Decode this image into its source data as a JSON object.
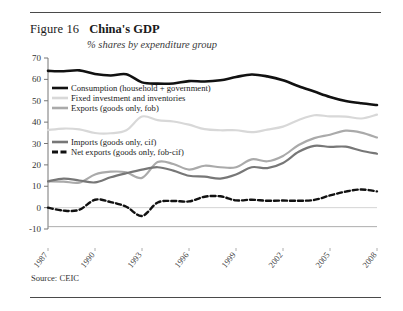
{
  "figure": {
    "number": "Figure 16",
    "title": "China's GDP",
    "subtitle": "% shares by expenditure group",
    "source": "Source: CEIC"
  },
  "chart_data": {
    "type": "line",
    "title": "China's GDP",
    "subtitle": "% shares by expenditure group",
    "xlabel": "",
    "ylabel": "",
    "ylim": [
      -10,
      70
    ],
    "ytick_labels": [
      "70",
      "60",
      "50",
      "40",
      "30",
      "20",
      "10",
      "0",
      "-10"
    ],
    "ytick_values": [
      70,
      60,
      50,
      40,
      30,
      20,
      10,
      0,
      -10
    ],
    "grid": false,
    "legend_position": "inside-upper-left",
    "x": [
      1987,
      1988,
      1989,
      1990,
      1991,
      1992,
      1993,
      1994,
      1995,
      1996,
      1997,
      1998,
      1999,
      2000,
      2001,
      2002,
      2003,
      2004,
      2005,
      2006,
      2007,
      2008
    ],
    "xtick_labels": [
      "1987",
      "1990",
      "1993",
      "1996",
      "1999",
      "2002",
      "2005",
      "2008"
    ],
    "xtick_values": [
      1987,
      1990,
      1993,
      1996,
      1999,
      2002,
      2005,
      2008
    ],
    "series": [
      {
        "name": "Consumption (household + government)",
        "color": "#111111",
        "style": "solid",
        "width": 2.6,
        "values": [
          64.0,
          63.8,
          64.2,
          62.5,
          61.8,
          62.4,
          58.6,
          58.0,
          58.1,
          59.2,
          59.0,
          59.6,
          61.1,
          62.3,
          61.4,
          59.6,
          56.8,
          54.3,
          51.8,
          49.9,
          48.8,
          48.0
        ]
      },
      {
        "name": "Fixed investment and inventories",
        "color": "#d8d8d8",
        "style": "solid",
        "width": 2.2,
        "values": [
          36.3,
          37.0,
          36.6,
          34.9,
          34.8,
          36.2,
          42.6,
          40.9,
          40.3,
          38.8,
          36.7,
          36.2,
          36.2,
          35.3,
          36.5,
          37.9,
          41.0,
          43.2,
          42.7,
          42.6,
          41.7,
          43.5
        ]
      },
      {
        "name": "Exports (goods only, fob)",
        "color": "#aaaaaa",
        "style": "solid",
        "width": 2.2,
        "values": [
          12.3,
          12.2,
          11.7,
          15.5,
          16.8,
          16.5,
          13.9,
          21.3,
          20.4,
          17.8,
          19.6,
          18.9,
          18.9,
          22.6,
          21.7,
          24.2,
          29.3,
          32.5,
          34.1,
          36.0,
          35.1,
          32.8
        ]
      },
      {
        "name": "Imports (goods only, cif)",
        "color": "#777777",
        "style": "solid",
        "width": 2.2,
        "values": [
          12.3,
          13.6,
          12.7,
          11.8,
          14.2,
          16.1,
          17.8,
          18.9,
          17.3,
          14.9,
          14.5,
          13.6,
          15.5,
          18.9,
          18.5,
          20.9,
          26.1,
          28.9,
          28.4,
          28.5,
          26.6,
          25.2
        ]
      },
      {
        "name": "Net exports (goods only, fob-cif)",
        "color": "#111111",
        "style": "dashed",
        "width": 2.4,
        "values": [
          0.0,
          -1.4,
          -1.0,
          3.7,
          2.6,
          0.4,
          -3.9,
          2.4,
          3.1,
          2.9,
          5.1,
          5.3,
          3.4,
          3.7,
          3.2,
          3.3,
          3.2,
          3.6,
          5.7,
          7.5,
          8.5,
          7.6
        ]
      }
    ]
  },
  "legend": {
    "items": [
      {
        "label": "Consumption (household + government)"
      },
      {
        "label": "Fixed investment and inventories"
      },
      {
        "label": "Exports (goods only, fob)"
      },
      {
        "label": "Imports (goods only, cif)"
      },
      {
        "label": "Net exports (goods only, fob-cif)"
      }
    ]
  }
}
